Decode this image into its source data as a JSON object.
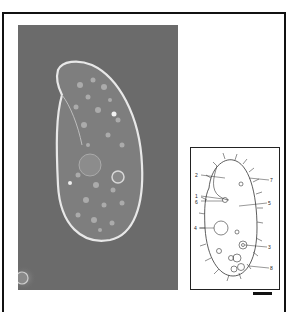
{
  "figure": {
    "photo": {
      "description": "Phase-contrast micrograph of a ciliate cell",
      "background_color": "#6c6c6c"
    },
    "diagram": {
      "labels": [
        {
          "id": "2",
          "text": "2"
        },
        {
          "id": "7",
          "text": "7"
        },
        {
          "id": "1",
          "text": "1"
        },
        {
          "id": "6",
          "text": "6"
        },
        {
          "id": "5",
          "text": "5"
        },
        {
          "id": "4",
          "text": "4"
        },
        {
          "id": "3",
          "text": "3"
        },
        {
          "id": "8",
          "text": "8"
        }
      ]
    },
    "scale_bar": {
      "visible": true
    }
  }
}
